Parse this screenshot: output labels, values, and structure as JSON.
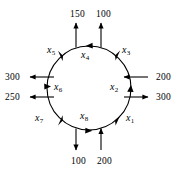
{
  "diagram": {
    "type": "pipe-network-flow-diagram",
    "shape": "circle",
    "circulation_direction": "counterclockwise",
    "segments": [
      {
        "id": "x1",
        "name": "x",
        "index": "1",
        "x": 128,
        "y": 118
      },
      {
        "id": "x2",
        "name": "x",
        "index": "2",
        "x": 112,
        "y": 87
      },
      {
        "id": "x3",
        "name": "x",
        "index": "3",
        "x": 126,
        "y": 50
      },
      {
        "id": "x4",
        "name": "x",
        "index": "4",
        "x": 84,
        "y": 54
      },
      {
        "id": "x5",
        "name": "x",
        "index": "5",
        "x": 50,
        "y": 49
      },
      {
        "id": "x6",
        "name": "x",
        "index": "6",
        "x": 55,
        "y": 86
      },
      {
        "id": "x7",
        "name": "x",
        "index": "7",
        "x": 38,
        "y": 118
      },
      {
        "id": "x8",
        "name": "x",
        "index": "8",
        "x": 83,
        "y": 116
      }
    ],
    "external_flows": [
      {
        "id": "top-left-out",
        "value": "150",
        "direction": "out",
        "side": "top",
        "x": 70,
        "y": 10
      },
      {
        "id": "top-right-in",
        "value": "100",
        "direction": "in",
        "side": "top",
        "x": 96,
        "y": 10
      },
      {
        "id": "right-upper-in",
        "value": "200",
        "direction": "in",
        "side": "right",
        "x": 156,
        "y": 74
      },
      {
        "id": "right-lower-out",
        "value": "300",
        "direction": "out",
        "side": "right",
        "x": 156,
        "y": 94
      },
      {
        "id": "bottom-left-out",
        "value": "100",
        "direction": "out",
        "side": "bottom",
        "x": 71,
        "y": 157
      },
      {
        "id": "bottom-right-in",
        "value": "200",
        "direction": "in",
        "side": "bottom",
        "x": 97,
        "y": 157
      },
      {
        "id": "left-upper-out",
        "value": "300",
        "direction": "out",
        "side": "left",
        "x": 6,
        "y": 74
      },
      {
        "id": "left-lower-out",
        "value": "250",
        "direction": "out",
        "side": "left",
        "x": 6,
        "y": 94
      }
    ],
    "colors": {
      "stroke": "#000000",
      "background": "#ffffff",
      "text": "#000000"
    }
  }
}
